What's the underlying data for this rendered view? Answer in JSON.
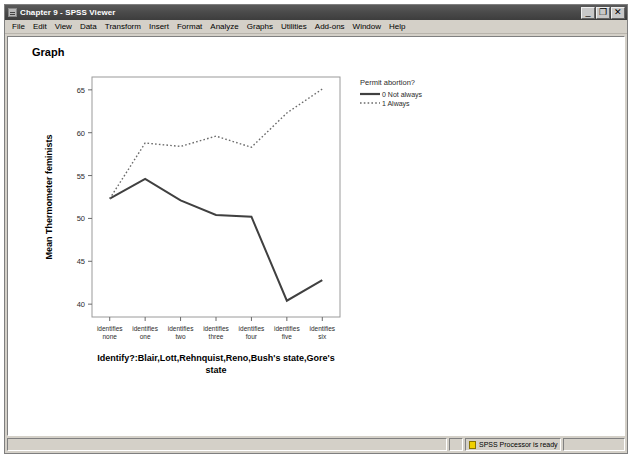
{
  "window": {
    "title": "Chapter 9 - SPSS Viewer",
    "icon": "spss-window-icon",
    "buttons": {
      "minimize": "_",
      "restore": "❐",
      "close": "✕"
    }
  },
  "menu": {
    "items": [
      {
        "label": "File"
      },
      {
        "label": "Edit"
      },
      {
        "label": "View"
      },
      {
        "label": "Data"
      },
      {
        "label": "Transform"
      },
      {
        "label": "Insert"
      },
      {
        "label": "Format"
      },
      {
        "label": "Analyze"
      },
      {
        "label": "Graphs"
      },
      {
        "label": "Utilities"
      },
      {
        "label": "Add-ons"
      },
      {
        "label": "Window"
      },
      {
        "label": "Help"
      }
    ]
  },
  "document": {
    "heading": "Graph"
  },
  "status": {
    "processor_icon": "spss-processor-icon",
    "message": "SPSS Processor  is ready",
    "left_cell": "",
    "right_cell": ""
  },
  "chart_data": {
    "type": "line",
    "title": "",
    "xlabel": "Identify?:Blair,Lott,Rehnquist,Reno,Bush's state,Gore's state",
    "ylabel": "Mean Thermometer feminists",
    "categories": [
      "identifies none",
      "identifies one",
      "identifies two",
      "identifies three",
      "identifies four",
      "identifies five",
      "identifies six"
    ],
    "category_lines": [
      [
        "identifies",
        "none"
      ],
      [
        "identifies",
        "one"
      ],
      [
        "identifies",
        "two"
      ],
      [
        "identifies",
        "three"
      ],
      [
        "identifies",
        "four"
      ],
      [
        "identifies",
        "five"
      ],
      [
        "identifies",
        "six"
      ]
    ],
    "ylim": [
      38.5,
      66.5
    ],
    "yticks": [
      40,
      45,
      50,
      55,
      60,
      65
    ],
    "ytick_labels": [
      "40",
      "45",
      "50",
      "55",
      "60",
      "65"
    ],
    "grid": false,
    "legend_position": "right",
    "legend_title": "Permit abortion?",
    "series": [
      {
        "name": "0 Not always",
        "style": "solid",
        "color": "#404040",
        "values": [
          52.3,
          54.6,
          52.1,
          50.4,
          50.2,
          40.4,
          42.8
        ]
      },
      {
        "name": "1 Always",
        "style": "dotted",
        "color": "#6b6b6b",
        "values": [
          52.3,
          58.8,
          58.4,
          59.6,
          58.3,
          62.3,
          65.1
        ]
      }
    ]
  }
}
